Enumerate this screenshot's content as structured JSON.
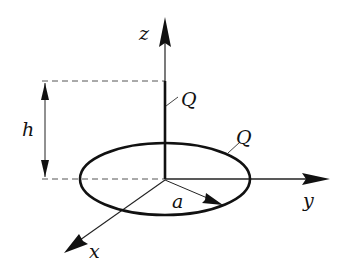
{
  "diagram": {
    "axes": {
      "x_label": "x",
      "y_label": "y",
      "z_label": "z"
    },
    "labels": {
      "height": "h",
      "radius": "a",
      "rod_charge": "Q",
      "ring_charge": "Q"
    },
    "colors": {
      "stroke": "#111111",
      "dashed": "#555555",
      "background": "#ffffff"
    }
  }
}
